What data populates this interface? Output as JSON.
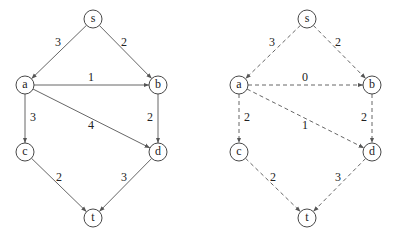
{
  "graphs": [
    {
      "id": "original",
      "style": "solid",
      "offset_x": 0,
      "nodes": [
        {
          "id": "s",
          "label": "s",
          "x": 93,
          "y": 19
        },
        {
          "id": "a",
          "label": "a",
          "x": 25,
          "y": 85
        },
        {
          "id": "b",
          "label": "b",
          "x": 158,
          "y": 85
        },
        {
          "id": "c",
          "label": "c",
          "x": 25,
          "y": 152
        },
        {
          "id": "d",
          "label": "d",
          "x": 158,
          "y": 152
        },
        {
          "id": "t",
          "label": "t",
          "x": 93,
          "y": 218
        }
      ],
      "edges": [
        {
          "from": "s",
          "to": "a",
          "weight": "3",
          "lx": 58,
          "ly": 42
        },
        {
          "from": "s",
          "to": "b",
          "weight": "2",
          "lx": 124,
          "ly": 42
        },
        {
          "from": "a",
          "to": "b",
          "weight": "1",
          "lx": 91,
          "ly": 77
        },
        {
          "from": "a",
          "to": "c",
          "weight": "3",
          "lx": 33,
          "ly": 117
        },
        {
          "from": "a",
          "to": "d",
          "weight": "4",
          "lx": 91,
          "ly": 125
        },
        {
          "from": "b",
          "to": "d",
          "weight": "2",
          "lx": 150,
          "ly": 117
        },
        {
          "from": "c",
          "to": "t",
          "weight": "2",
          "lx": 59,
          "ly": 177
        },
        {
          "from": "d",
          "to": "t",
          "weight": "3",
          "lx": 124,
          "ly": 177
        }
      ]
    },
    {
      "id": "reweighted",
      "style": "dashed",
      "offset_x": 214,
      "nodes": [
        {
          "id": "s",
          "label": "s",
          "x": 93,
          "y": 19
        },
        {
          "id": "a",
          "label": "a",
          "x": 25,
          "y": 85
        },
        {
          "id": "b",
          "label": "b",
          "x": 158,
          "y": 85
        },
        {
          "id": "c",
          "label": "c",
          "x": 25,
          "y": 152
        },
        {
          "id": "d",
          "label": "d",
          "x": 158,
          "y": 152
        },
        {
          "id": "t",
          "label": "t",
          "x": 93,
          "y": 218
        }
      ],
      "edges": [
        {
          "from": "s",
          "to": "a",
          "weight": "3",
          "lx": 58,
          "ly": 42
        },
        {
          "from": "s",
          "to": "b",
          "weight": "2",
          "lx": 124,
          "ly": 42
        },
        {
          "from": "a",
          "to": "b",
          "weight": "0",
          "lx": 91,
          "ly": 77
        },
        {
          "from": "a",
          "to": "c",
          "weight": "2",
          "lx": 33,
          "ly": 117
        },
        {
          "from": "a",
          "to": "d",
          "weight": "1",
          "lx": 91,
          "ly": 125
        },
        {
          "from": "b",
          "to": "d",
          "weight": "2",
          "lx": 150,
          "ly": 117
        },
        {
          "from": "c",
          "to": "t",
          "weight": "2",
          "lx": 59,
          "ly": 177
        },
        {
          "from": "d",
          "to": "t",
          "weight": "3",
          "lx": 124,
          "ly": 177
        }
      ]
    }
  ],
  "node_radius": 9,
  "colors": {
    "stroke": "#555555",
    "node_stroke": "#333333",
    "text": "#222222",
    "background": "#ffffff"
  }
}
